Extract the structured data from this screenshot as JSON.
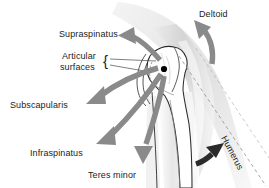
{
  "figure": {
    "background_color": "#ffffff"
  },
  "colors": {
    "label_text": "#1c1c1c",
    "arrow_gray": "#8a8a8a",
    "arrow_gray_light": "#a8a8a8",
    "arrow_dark": "#2b2b2b",
    "bone_outline": "#2b2b2b",
    "soft_tissue": "#d9d9d9",
    "dashed_axis": "#9a9a9a",
    "center_dot": "#000000"
  },
  "labels": {
    "deltoid": "Deltoid",
    "supraspinatus": "Supraspinatus",
    "articular_line1": "Articular",
    "articular_line2": "surfaces",
    "articular_brace": "{",
    "subscapularis": "Subscapularis",
    "infraspinatus": "Infraspinatus",
    "teres_minor": "Teres minor",
    "humerus": "Humerus"
  },
  "annotations": [
    {
      "name": "deltoid",
      "label": "Deltoid",
      "arrow": "curved-arrow-up-left",
      "arrow_color": "#8a8a8a"
    },
    {
      "name": "supraspinatus",
      "label": "Supraspinatus",
      "arrow": "curved-arrow-left",
      "arrow_color": "#8a8a8a"
    },
    {
      "name": "articular-surfaces",
      "label": "Articular surfaces",
      "arrow": "two-leader-lines",
      "arrow_color": "#8a8a8a"
    },
    {
      "name": "subscapularis",
      "label": "Subscapularis",
      "arrow": "curved-arrow-down-left",
      "arrow_color": "#8a8a8a"
    },
    {
      "name": "infraspinatus",
      "label": "Infraspinatus",
      "arrow": "curved-arrow-down-left",
      "arrow_color": "#8a8a8a"
    },
    {
      "name": "teres-minor",
      "label": "Teres minor",
      "arrow": "curved-arrow-down",
      "arrow_color": "#8a8a8a"
    },
    {
      "name": "humerus",
      "label": "Humerus",
      "arrow": "curved-arrow-up-right",
      "arrow_color": "#2b2b2b"
    }
  ],
  "markers": {
    "center_of_rotation": "black-dot"
  }
}
